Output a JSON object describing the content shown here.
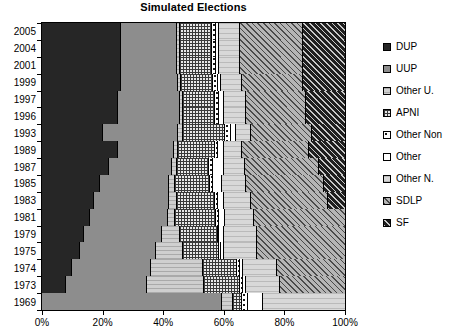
{
  "chart_data": {
    "type": "bar",
    "subtype": "stacked-horizontal-100pct",
    "title": "Simulated Elections",
    "xlabel": "",
    "ylabel": "",
    "xlim": [
      0,
      100
    ],
    "xticks": [
      "0%",
      "20%",
      "40%",
      "60%",
      "80%",
      "100%"
    ],
    "xtick_values": [
      0,
      20,
      40,
      60,
      80,
      100
    ],
    "grid": false,
    "legend_position": "right",
    "categories": [
      "2005",
      "2004",
      "2001",
      "1999",
      "1997",
      "1996",
      "1993",
      "1989",
      "1987",
      "1985",
      "1983",
      "1981",
      "1979",
      "1975",
      "1974",
      "1973",
      "1969"
    ],
    "series": [
      {
        "name": "DUP",
        "key": "dup",
        "pattern": "solid-dark",
        "color": "#262626",
        "values": [
          26.0,
          26.0,
          26.0,
          26.0,
          25.0,
          25.0,
          20.0,
          25.0,
          22.0,
          19.0,
          17.0,
          16.0,
          14.0,
          12.5,
          10.0,
          8.0,
          0.0
        ]
      },
      {
        "name": "UUP",
        "key": "uup",
        "pattern": "solid-grey",
        "color": "#8d8d8d",
        "values": [
          18.5,
          18.5,
          18.5,
          19.0,
          20.5,
          20.5,
          25.0,
          18.5,
          21.0,
          23.0,
          25.0,
          25.5,
          25.5,
          25.0,
          26.0,
          26.5,
          59.5
        ]
      },
      {
        "name": "Other U.",
        "key": "other_u",
        "pattern": "light-horizontal",
        "color": "#cfcfcf",
        "values": [
          1.0,
          1.0,
          1.0,
          1.0,
          1.0,
          1.0,
          1.5,
          1.5,
          1.5,
          2.0,
          2.5,
          2.5,
          6.0,
          9.0,
          17.0,
          19.0,
          3.5
        ]
      },
      {
        "name": "APNI",
        "key": "apni",
        "pattern": "checker",
        "color": "#e8e8e8",
        "values": [
          10.5,
          10.5,
          10.5,
          10.5,
          10.5,
          10.5,
          14.0,
          12.0,
          10.5,
          11.5,
          12.5,
          13.5,
          12.5,
          12.0,
          11.5,
          12.0,
          3.0
        ]
      },
      {
        "name": "Other Non",
        "key": "other_non",
        "pattern": "white-dotted",
        "color": "#ffffff",
        "values": [
          1.5,
          1.5,
          1.5,
          1.5,
          1.5,
          1.5,
          2.0,
          1.0,
          1.5,
          1.0,
          1.0,
          1.0,
          0.5,
          0.5,
          1.0,
          1.0,
          2.0
        ]
      },
      {
        "name": "Other",
        "key": "other",
        "pattern": "white",
        "color": "#ffffff",
        "values": [
          1.0,
          1.0,
          1.0,
          1.0,
          1.5,
          1.5,
          1.5,
          2.0,
          3.5,
          3.0,
          2.0,
          2.0,
          1.5,
          1.0,
          1.0,
          1.0,
          5.0
        ]
      },
      {
        "name": "Other N.",
        "key": "other_n",
        "pattern": "light-grid",
        "color": "#d8d8d8",
        "values": [
          7.0,
          7.0,
          7.0,
          7.0,
          7.5,
          7.5,
          5.0,
          6.0,
          7.0,
          8.0,
          9.0,
          9.5,
          11.0,
          11.0,
          11.0,
          11.0,
          27.0
        ]
      },
      {
        "name": "SDLP",
        "key": "sdlp",
        "pattern": "diagonal-grey",
        "color": "#b5b5b5",
        "values": [
          20.5,
          20.5,
          20.5,
          20.0,
          19.5,
          19.5,
          20.0,
          22.0,
          24.5,
          25.5,
          25.5,
          30.0,
          29.0,
          29.0,
          22.5,
          21.5,
          0.0
        ]
      },
      {
        "name": "SF",
        "key": "sf",
        "pattern": "diagonal-dark",
        "color": "#1f1f1f",
        "values": [
          14.0,
          14.0,
          14.0,
          14.0,
          13.0,
          13.0,
          11.0,
          12.0,
          8.5,
          7.0,
          5.5,
          0.0,
          0.0,
          0.0,
          0.0,
          0.0,
          0.0
        ]
      }
    ]
  },
  "legend": {
    "items": [
      {
        "label": "DUP"
      },
      {
        "label": "UUP"
      },
      {
        "label": "Other U."
      },
      {
        "label": "APNI"
      },
      {
        "label": "Other Non"
      },
      {
        "label": "Other"
      },
      {
        "label": "Other N."
      },
      {
        "label": "SDLP"
      },
      {
        "label": "SF"
      }
    ]
  }
}
